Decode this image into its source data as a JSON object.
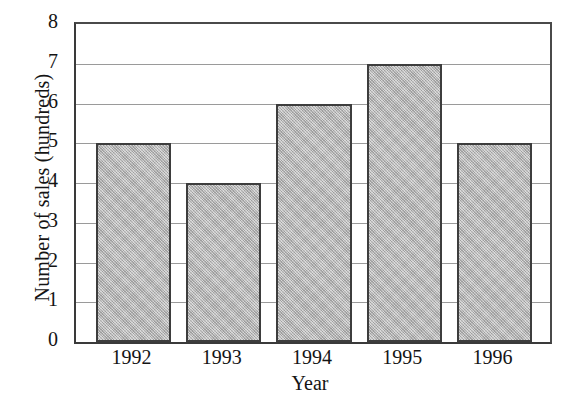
{
  "chart_data": {
    "type": "bar",
    "title": "",
    "xlabel": "Year",
    "ylabel": "Number of sales (hundreds)",
    "categories": [
      "1992",
      "1993",
      "1994",
      "1995",
      "1996"
    ],
    "values": [
      5,
      4,
      6,
      7,
      5
    ],
    "ylim": [
      0,
      8
    ],
    "y_ticks": [
      "8",
      "7",
      "6",
      "5",
      "4",
      "3",
      "2",
      "1",
      "0"
    ],
    "y_tick_values": [
      8,
      7,
      6,
      5,
      4,
      3,
      2,
      1,
      0
    ],
    "grid": "horizontal",
    "legend": "none",
    "bar_fill_color": "#b5b5b5",
    "bar_edge_color": "#3d3d3d",
    "gridline_color": "#9a9a9a",
    "axis_color": "#3a3a3a",
    "background_color": "#ffffff"
  },
  "axes": {
    "y_title": "Number of sales (hundreds)",
    "x_title": "Year"
  },
  "bars": [
    {
      "category": "1992",
      "value": 5,
      "label": "1992"
    },
    {
      "category": "1993",
      "value": 4,
      "label": "1993"
    },
    {
      "category": "1994",
      "value": 6,
      "label": "1994"
    },
    {
      "category": "1995",
      "value": 7,
      "label": "1995"
    },
    {
      "category": "1996",
      "value": 5,
      "label": "1996"
    }
  ]
}
